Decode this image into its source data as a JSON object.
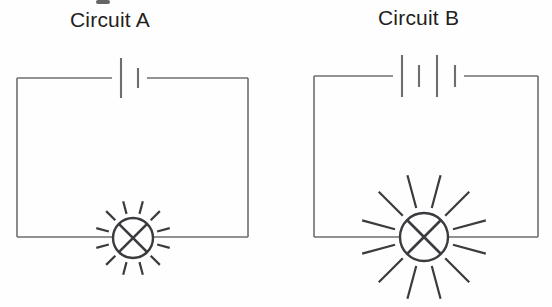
{
  "page": {
    "background_color": "#fefefe",
    "ink_color": "#6e6e72",
    "bulb_ink_color": "#3b3b3f",
    "label_color": "#231f20"
  },
  "circuits": [
    {
      "id": "circuit-a",
      "label": "Circuit A",
      "label_x": 70,
      "label_y": 8,
      "cells": 1,
      "brightness": "dim",
      "frame": {
        "x": 17,
        "y": 78,
        "width": 231,
        "height": 159
      },
      "battery": {
        "gap_start": 112,
        "gap_end": 147,
        "plates": [
          {
            "x": 121,
            "half_height": 20,
            "type": "long"
          },
          {
            "x": 138,
            "half_height": 10,
            "type": "short"
          }
        ]
      },
      "bulb": {
        "cx": 133,
        "cy": 238,
        "r": 20,
        "wire_gap_left": 113,
        "wire_gap_right": 153,
        "ray_count": 12,
        "ray_inner": 25,
        "ray_outer": 38
      }
    },
    {
      "id": "circuit-b",
      "label": "Circuit B",
      "label_x": 378,
      "label_y": 6,
      "cells": 2,
      "brightness": "bright",
      "frame": {
        "x": 314,
        "y": 76,
        "width": 224,
        "height": 161
      },
      "battery": {
        "gap_start": 393,
        "gap_end": 464,
        "plates": [
          {
            "x": 402,
            "half_height": 21,
            "type": "long"
          },
          {
            "x": 419,
            "half_height": 11,
            "type": "short"
          },
          {
            "x": 437,
            "half_height": 21,
            "type": "long"
          },
          {
            "x": 455,
            "half_height": 11,
            "type": "short"
          }
        ]
      },
      "bulb": {
        "cx": 424,
        "cy": 237,
        "r": 24,
        "wire_gap_left": 400,
        "wire_gap_right": 448,
        "ray_count": 12,
        "ray_inner": 30,
        "ray_outer": 64
      }
    }
  ],
  "artifacts": {
    "top_mark": {
      "x": 96,
      "y": 0,
      "width": 14,
      "height": 4
    }
  }
}
